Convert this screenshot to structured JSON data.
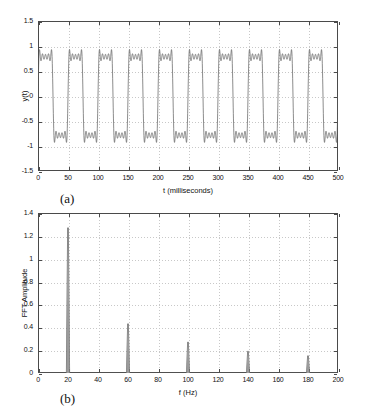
{
  "figure": {
    "background": "#ffffff",
    "axis_color": "#4a4a4a",
    "grid_color": "#c8c8c8",
    "curve_color": "#5a5a5a"
  },
  "panels": [
    {
      "tag": "(a)",
      "name": "time-domain-waveform"
    },
    {
      "tag": "(b)",
      "name": "fft-amplitude-spectrum"
    }
  ],
  "chart_data": [
    {
      "type": "line",
      "name": "time-domain-waveform",
      "panel": "(a)",
      "title": "",
      "xlabel": "t (milliseconds)",
      "ylabel": "y(t)",
      "xlim": [
        0,
        500
      ],
      "ylim": [
        -1.5,
        1.5
      ],
      "xticks": [
        0,
        50,
        100,
        150,
        200,
        250,
        300,
        350,
        400,
        450,
        500
      ],
      "xticklabels": [
        "0",
        "50",
        "100",
        "150",
        "200",
        "250",
        "300",
        "350",
        "400",
        "450",
        "500"
      ],
      "yticks": [
        -1.5,
        -1,
        -0.5,
        0,
        0.5,
        1,
        1.5
      ],
      "yticklabels": [
        "-1.5",
        "-1",
        "-0.5",
        "0",
        "0.5",
        "1",
        "1.5"
      ],
      "grid": true,
      "legend": null,
      "description": "Truncated Fourier series square wave with Gibbs ripple, period 50 ms (20 Hz fundamental), plateau levels near +1 and -1 with overshoot to about +-1.2",
      "series": [
        {
          "name": "y(t)",
          "period_ms": 50,
          "duty_cycle": 0.5,
          "fundamental_hz": 20,
          "harmonics_hz": [
            20,
            60,
            100,
            140,
            180
          ],
          "harmonic_amplitudes": [
            1.27,
            0.43,
            0.27,
            0.19,
            0.15
          ],
          "overshoot_high": 1.2,
          "overshoot_low": -1.2,
          "plateau_high": 1.0,
          "plateau_low": -1.0
        }
      ]
    },
    {
      "type": "line",
      "name": "fft-amplitude-spectrum",
      "panel": "(b)",
      "title": "",
      "xlabel": "f (Hz)",
      "ylabel": "FFT Amplitude",
      "xlim": [
        0,
        200
      ],
      "ylim": [
        0,
        1.4
      ],
      "xticks": [
        0,
        20,
        40,
        60,
        80,
        100,
        120,
        140,
        160,
        180,
        200
      ],
      "xticklabels": [
        "0",
        "20",
        "40",
        "60",
        "80",
        "100",
        "120",
        "140",
        "160",
        "180",
        "200"
      ],
      "yticks": [
        0,
        0.2,
        0.4,
        0.6,
        0.8,
        1,
        1.2,
        1.4
      ],
      "yticklabels": [
        "0",
        "0.2",
        "0.4",
        "0.6",
        "0.8",
        "1",
        "1.2",
        "1.4"
      ],
      "grid": true,
      "legend": null,
      "description": "Line spectrum with narrow peaks at odd harmonics of 20 Hz",
      "x": [
        20,
        60,
        100,
        140,
        180
      ],
      "values": [
        1.27,
        0.43,
        0.27,
        0.19,
        0.15
      ],
      "peaks": [
        {
          "f": 20,
          "amplitude": 1.27
        },
        {
          "f": 60,
          "amplitude": 0.43
        },
        {
          "f": 100,
          "amplitude": 0.27
        },
        {
          "f": 140,
          "amplitude": 0.19
        },
        {
          "f": 180,
          "amplitude": 0.15
        }
      ]
    }
  ]
}
